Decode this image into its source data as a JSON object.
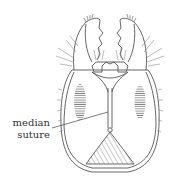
{
  "figure": {
    "stroke_color": "#555555",
    "hatch_color": "#666666",
    "background": "#ffffff"
  },
  "labels": {
    "median_suture": {
      "line1": "median",
      "line2": "suture"
    }
  }
}
